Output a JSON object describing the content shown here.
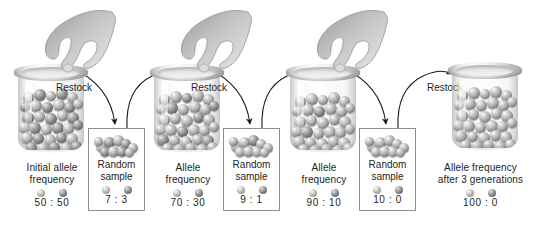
{
  "figure": {
    "background_color": "#ffffff",
    "text_color": "#231f20",
    "box_border_color": "#8d8d8d",
    "allele_light_color": "#a9a9a9",
    "allele_dark_color": "#4e4e4e"
  },
  "stages": [
    {
      "kind": "jar",
      "name": "initial-population-jar",
      "has_hand": true,
      "caption_lines": [
        "Initial allele",
        "frequency"
      ],
      "ratio": "50 : 50",
      "marble_count": 46
    },
    {
      "kind": "sample",
      "name": "random-sample-1",
      "caption_lines": [
        "Random",
        "sample"
      ],
      "ratio": "7 : 3",
      "marble_count": 10
    },
    {
      "kind": "jar",
      "name": "generation-1-jar",
      "has_hand": true,
      "caption_lines": [
        "Allele",
        "frequency"
      ],
      "ratio": "70 : 30",
      "marble_count": 46
    },
    {
      "kind": "sample",
      "name": "random-sample-2",
      "caption_lines": [
        "Random",
        "sample"
      ],
      "ratio": "9 : 1",
      "marble_count": 10
    },
    {
      "kind": "jar",
      "name": "generation-2-jar",
      "has_hand": true,
      "caption_lines": [
        "Allele",
        "frequency"
      ],
      "ratio": "90 : 10",
      "marble_count": 46
    },
    {
      "kind": "sample",
      "name": "random-sample-3",
      "caption_lines": [
        "Random",
        "sample"
      ],
      "ratio": "10 : 0",
      "marble_count": 10
    },
    {
      "kind": "jar",
      "name": "generation-3-jar",
      "has_hand": false,
      "caption_lines": [
        "Allele frequency",
        "after 3 generations"
      ],
      "ratio": "100 : 0",
      "marble_count": 46
    }
  ],
  "restock_labels": [
    {
      "name": "restock-label-1",
      "text": "Restock"
    },
    {
      "name": "restock-label-2",
      "text": "Restock"
    },
    {
      "name": "restock-label-3",
      "text": "Restock"
    }
  ],
  "arrows": {
    "sampling_arrow_name": "sampling-arrow",
    "restock_arrow_name": "restock-arrow",
    "count_sampling": 3,
    "count_restock": 3
  }
}
